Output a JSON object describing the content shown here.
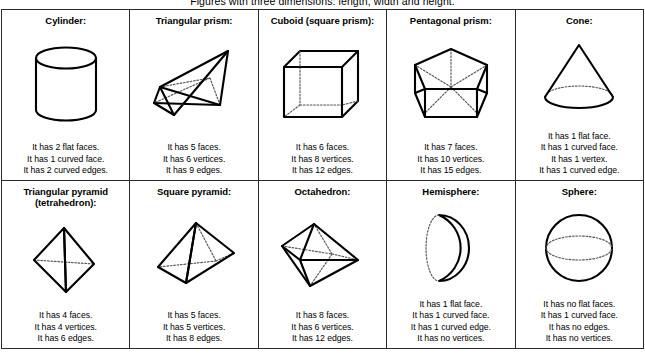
{
  "document": {
    "title": "Figures with three dimensions: length, width and height."
  },
  "table": {
    "rows": [
      {
        "cells": [
          {
            "name": "cylinder",
            "heading": "Cylinder:",
            "icon": "cylinder-shape",
            "facts": [
              "It has 2 flat faces.",
              "It has 1 curved face.",
              "It has 2 curved edges."
            ]
          },
          {
            "name": "triangular-prism",
            "heading": "Triangular prism:",
            "icon": "triangular-prism-shape",
            "facts": [
              "It has 5 faces.",
              "It has 6 vertices.",
              "It has 9 edges."
            ]
          },
          {
            "name": "cuboid",
            "heading": "Cuboid (square prism):",
            "icon": "cuboid-shape",
            "facts": [
              "It has 6 faces.",
              "It has 8 vertices.",
              "It has 12 edges."
            ]
          },
          {
            "name": "pentagonal-prism",
            "heading": "Pentagonal prism:",
            "icon": "pentagonal-prism-shape",
            "facts": [
              "It has 7 faces.",
              "It has 10 vertices.",
              "It has 15 edges."
            ]
          },
          {
            "name": "cone",
            "heading": "Cone:",
            "icon": "cone-shape",
            "facts": [
              "It has 1 flat face.",
              "It has 1 curved face.",
              "It has 1 vertex.",
              "It has 1 curved edge."
            ]
          }
        ]
      },
      {
        "cells": [
          {
            "name": "triangular-pyramid",
            "heading": "Triangular pyramid",
            "heading2": "(tetrahedron):",
            "icon": "tetrahedron-shape",
            "facts": [
              "It has 4 faces.",
              "It has 4 vertices.",
              "It has 6 edges."
            ]
          },
          {
            "name": "square-pyramid",
            "heading": "Square pyramid:",
            "icon": "square-pyramid-shape",
            "facts": [
              "It has 5 faces.",
              "It has 5 vertices.",
              "It has 8 edges."
            ]
          },
          {
            "name": "octahedron",
            "heading": "Octahedron:",
            "icon": "octahedron-shape",
            "facts": [
              "It has 8 faces.",
              "It has 6 vertices.",
              "It has 12 edges."
            ]
          },
          {
            "name": "hemisphere",
            "heading": "Hemisphere:",
            "icon": "hemisphere-shape",
            "facts": [
              "It has 1 flat face.",
              "It has 1 curved face.",
              "It has 1 curved edge.",
              "It has no vertices."
            ]
          },
          {
            "name": "sphere",
            "heading": "Sphere:",
            "icon": "sphere-shape",
            "facts": [
              "It has no flat faces.",
              "It has 1 curved face.",
              "It has no edges.",
              "It has no vertices."
            ]
          }
        ]
      }
    ]
  },
  "colors": {
    "ink": "#000000",
    "border": "#2b2b2b",
    "hidden_edge": "#555555",
    "background": "#ffffff"
  }
}
